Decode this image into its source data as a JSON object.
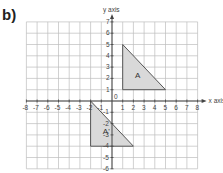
{
  "part_label": "b)",
  "axes": {
    "x_label": "x axis",
    "y_label": "y axis",
    "origin_label": "0",
    "x_min": -8,
    "x_max": 8,
    "y_min": -6,
    "y_max": 7,
    "x_ticks": [
      "-8",
      "-7",
      "-6",
      "-5",
      "-4",
      "-3",
      "-2",
      "-1",
      "1",
      "2",
      "3",
      "4",
      "5",
      "6",
      "7",
      "8"
    ],
    "y_ticks": [
      "7",
      "6",
      "5",
      "4",
      "3",
      "2",
      "1",
      "-1",
      "-2",
      "-3",
      "-4",
      "-5",
      "-6"
    ]
  },
  "shapes": [
    {
      "label": "A",
      "vertices": [
        [
          1,
          5
        ],
        [
          1,
          1
        ],
        [
          5,
          1
        ]
      ],
      "fill": "#d9d9d9",
      "stroke": "#555555"
    },
    {
      "label": "A'",
      "vertices": [
        [
          -2,
          0
        ],
        [
          -2,
          -4
        ],
        [
          2,
          -4
        ]
      ],
      "fill": "#d9d9d9",
      "stroke": "#555555"
    }
  ],
  "colors": {
    "grid": "#bdbdbd",
    "axis": "#444444",
    "text": "#444444"
  }
}
